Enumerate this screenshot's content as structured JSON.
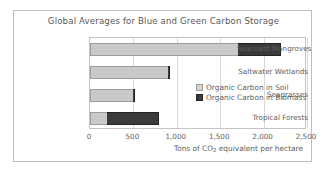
{
  "chart_data": {
    "type": "bar",
    "orientation": "horizontal",
    "stacked": true,
    "title": "Global Averages for Blue and Green Carbon Storage",
    "xlabel": "Tons of CO2 equivalent per hectare",
    "xlabel_parts": {
      "before": "Tons of CO",
      "sub": "2",
      "after": " equivalent per hectare"
    },
    "ylabel": "",
    "categories": [
      "Seacoast Mangroves",
      "Saltwater Wetlands",
      "Seagrasses",
      "Tropical Forests"
    ],
    "series": [
      {
        "name": "Organic Carbon in Soil",
        "color": "#c9c9c9",
        "values": [
          1700,
          900,
          500,
          200
        ]
      },
      {
        "name": "Organic Carbon in Biomass",
        "color": "#3a3a3a",
        "values": [
          500,
          25,
          20,
          600
        ]
      }
    ],
    "totals": [
      2200,
      925,
      520,
      800
    ],
    "xlim": [
      0,
      2500
    ],
    "xticks": [
      0,
      500,
      1000,
      1500,
      2000,
      2500
    ],
    "xticklabels": [
      "0",
      "500",
      "1,000",
      "1,500",
      "2,000",
      "2,500"
    ],
    "grid": "vertical",
    "legend_position": "inside-lower-right"
  },
  "colors": {
    "soil": "#c9c9c9",
    "biomass": "#3a3a3a",
    "text": "#5e5e5e",
    "frame": "#bfbfbf",
    "gridline": "#d9d9d9"
  }
}
